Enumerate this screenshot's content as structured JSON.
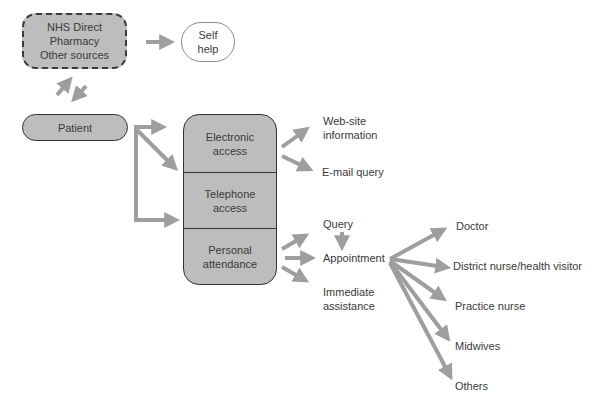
{
  "sources_box": {
    "lines": [
      "NHS Direct",
      "Pharmacy",
      "Other sources"
    ]
  },
  "self_help": {
    "lines": [
      "Self",
      "help"
    ]
  },
  "patient": {
    "label": "Patient"
  },
  "access": {
    "electronic": {
      "lines": [
        "Electronic",
        "access"
      ]
    },
    "telephone": {
      "lines": [
        "Telephone",
        "access"
      ]
    },
    "personal": {
      "lines": [
        "Personal",
        "attendance"
      ]
    }
  },
  "electronic_outcomes": {
    "website": {
      "lines": [
        "Web-site",
        "information"
      ]
    },
    "email": {
      "label": "E-mail query"
    }
  },
  "personal_outcomes": {
    "query": {
      "label": "Query"
    },
    "appointment": {
      "label": "Appointment"
    },
    "immediate": {
      "lines": [
        "Immediate",
        "assistance"
      ]
    }
  },
  "appointment_targets": [
    {
      "label": "Doctor"
    },
    {
      "label": "District nurse/health visitor"
    },
    {
      "label": "Practice nurse"
    },
    {
      "label": "Midwives"
    },
    {
      "label": "Others"
    }
  ],
  "colors": {
    "box_fill": "#bdbdbd",
    "arrow": "#9e9e9e",
    "border": "#333333"
  }
}
